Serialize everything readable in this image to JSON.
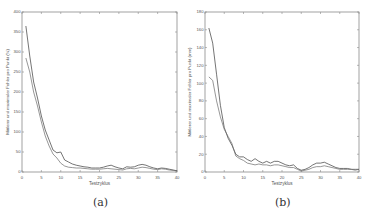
{
  "chart_data": [
    {
      "id": "a",
      "type": "line",
      "caption": "(a)",
      "title": "",
      "xlabel": "Testzyklus",
      "ylabel": "Mittlerer und maximaler Fehler pro Punkt (%)",
      "xlim": [
        0,
        40
      ],
      "ylim": [
        0,
        400
      ],
      "xticks": [
        0,
        5,
        10,
        15,
        20,
        25,
        30,
        35,
        40
      ],
      "yticks": [
        0,
        50,
        100,
        150,
        200,
        250,
        300,
        350,
        400
      ],
      "grid": false,
      "legend": null,
      "series": [
        {
          "name": "maximaler Fehler",
          "x": [
            1,
            2,
            3,
            4,
            5,
            6,
            7,
            8,
            9,
            10,
            11,
            12,
            13,
            14,
            15,
            16,
            17,
            18,
            19,
            20,
            21,
            22,
            23,
            24,
            25,
            26,
            27,
            28,
            29,
            30,
            31,
            32,
            33,
            34,
            35,
            36,
            37,
            38,
            39,
            40
          ],
          "values": [
            365,
            290,
            225,
            185,
            140,
            105,
            80,
            55,
            48,
            50,
            30,
            25,
            20,
            17,
            15,
            13,
            12,
            10,
            10,
            10,
            12,
            15,
            17,
            13,
            10,
            8,
            13,
            12,
            13,
            17,
            19,
            17,
            13,
            10,
            8,
            10,
            9,
            7,
            5,
            3
          ]
        },
        {
          "name": "mittlerer Fehler",
          "x": [
            1,
            2,
            3,
            4,
            5,
            6,
            7,
            8,
            9,
            10,
            11,
            12,
            13,
            14,
            15,
            16,
            17,
            18,
            19,
            20,
            21,
            22,
            23,
            24,
            25,
            26,
            27,
            28,
            29,
            30,
            31,
            32,
            33,
            34,
            35,
            36,
            37,
            38,
            39,
            40
          ],
          "values": [
            285,
            250,
            200,
            165,
            125,
            90,
            65,
            45,
            35,
            22,
            15,
            12,
            11,
            10,
            10,
            9,
            8,
            7,
            7,
            7,
            8,
            9,
            8,
            7,
            6,
            5,
            8,
            9,
            8,
            10,
            12,
            11,
            9,
            7,
            6,
            8,
            7,
            5,
            4,
            3
          ]
        }
      ]
    },
    {
      "id": "b",
      "type": "line",
      "caption": "(b)",
      "title": "",
      "xlabel": "Testzyklus",
      "ylabel": "Mittlerer und maximaler Fehler pro Punkt (mm)",
      "xlim": [
        0,
        40
      ],
      "ylim": [
        0,
        180
      ],
      "xticks": [
        0,
        5,
        10,
        15,
        20,
        25,
        30,
        35,
        40
      ],
      "yticks": [
        0,
        20,
        40,
        60,
        80,
        100,
        120,
        140,
        160,
        180
      ],
      "grid": false,
      "legend": null,
      "series": [
        {
          "name": "maximaler Fehler",
          "x": [
            1,
            2,
            3,
            4,
            5,
            6,
            7,
            8,
            9,
            10,
            11,
            12,
            13,
            14,
            15,
            16,
            17,
            18,
            19,
            20,
            21,
            22,
            23,
            24,
            25,
            26,
            27,
            28,
            29,
            30,
            31,
            32,
            33,
            34,
            35,
            36,
            37,
            38,
            39,
            40
          ],
          "values": [
            162,
            145,
            110,
            75,
            50,
            38,
            30,
            20,
            17,
            17,
            14,
            12,
            15,
            12,
            10,
            12,
            10,
            12,
            12,
            10,
            8,
            7,
            8,
            4,
            2,
            3,
            5,
            8,
            10,
            10,
            11,
            9,
            7,
            5,
            4,
            4,
            4,
            3,
            3,
            3
          ]
        },
        {
          "name": "mittlerer Fehler",
          "x": [
            1,
            2,
            3,
            4,
            5,
            6,
            7,
            8,
            9,
            10,
            11,
            12,
            13,
            14,
            15,
            16,
            17,
            18,
            19,
            20,
            21,
            22,
            23,
            24,
            25,
            26,
            27,
            28,
            29,
            30,
            31,
            32,
            33,
            34,
            35,
            36,
            37,
            38,
            39,
            40
          ],
          "values": [
            107,
            103,
            80,
            62,
            48,
            40,
            32,
            18,
            15,
            13,
            10,
            9,
            8,
            9,
            8,
            8,
            7,
            8,
            8,
            7,
            6,
            5,
            5,
            3,
            1,
            2,
            3,
            5,
            6,
            6,
            7,
            6,
            5,
            4,
            3,
            3,
            3,
            3,
            2,
            3
          ]
        }
      ]
    }
  ],
  "panels": {
    "a": {
      "caption": "(a)"
    },
    "b": {
      "caption": "(b)"
    }
  }
}
